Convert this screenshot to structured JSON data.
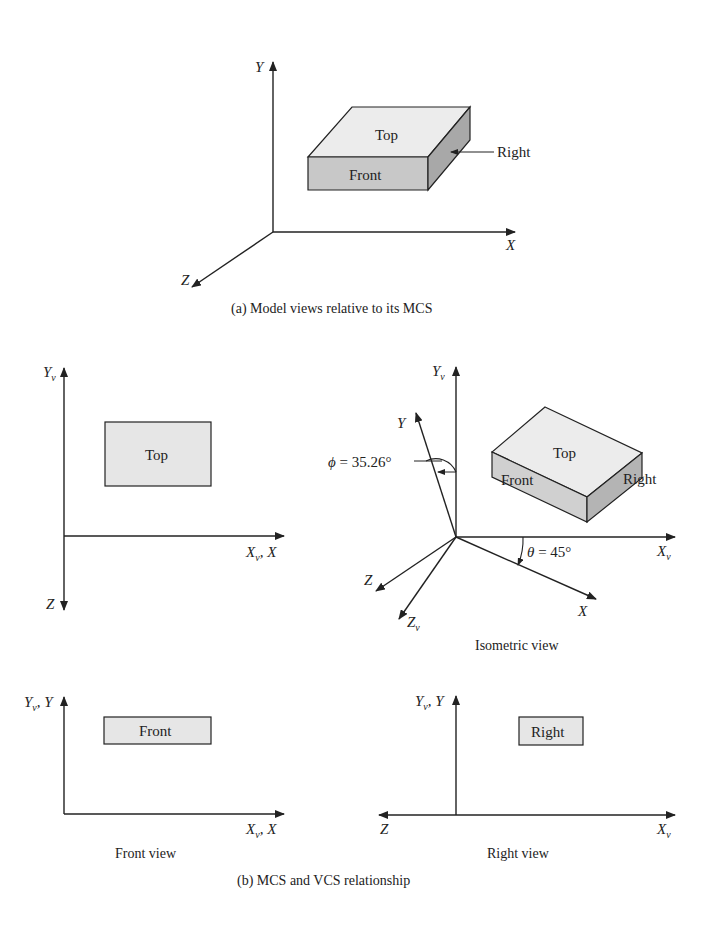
{
  "colors": {
    "line": "#222222",
    "face_light": "#ececec",
    "face_mid": "#d4d4d4",
    "face_dark": "#b8b8b8",
    "background": "#ffffff"
  },
  "part_a": {
    "caption_prefix": "(a)",
    "caption_text": " Model views relative to its MCS",
    "axes": {
      "y": "Y",
      "x": "X",
      "z": "Z"
    },
    "faces": {
      "top": "Top",
      "front": "Front",
      "right": "Right"
    }
  },
  "part_b": {
    "caption_prefix": "(b)",
    "caption_text": " MCS and VCS relationship",
    "top_view": {
      "axis_yv": "Y",
      "axis_yv_sub": "v",
      "axis_x_main": "X",
      "axis_x_sub": "v",
      "axis_x_suffix": ", X",
      "axis_z": "Z",
      "face": "Top"
    },
    "isometric_view": {
      "caption": "Isometric view",
      "axis_yv": "Y",
      "axis_yv_sub": "v",
      "axis_y": "Y",
      "axis_xv": "X",
      "axis_xv_sub": "v",
      "axis_x": "X",
      "axis_z": "Z",
      "axis_zv": "Z",
      "axis_zv_sub": "v",
      "phi_symbol": "ϕ",
      "phi_value": " = 35.26°",
      "theta_symbol": "θ",
      "theta_value": " = 45°",
      "faces": {
        "top": "Top",
        "front": "Front",
        "right": "Right"
      }
    },
    "front_view": {
      "caption": "Front view",
      "axis_y_main": "Y",
      "axis_y_sub": "v",
      "axis_y_suffix": ", Y",
      "axis_x_main": "X",
      "axis_x_sub": "v",
      "axis_x_suffix": ", X",
      "face": "Front"
    },
    "right_view": {
      "caption": "Right view",
      "axis_y_main": "Y",
      "axis_y_sub": "v",
      "axis_y_suffix": ", Y",
      "axis_xv": "X",
      "axis_xv_sub": "v",
      "axis_z": "Z",
      "face": "Right"
    }
  }
}
